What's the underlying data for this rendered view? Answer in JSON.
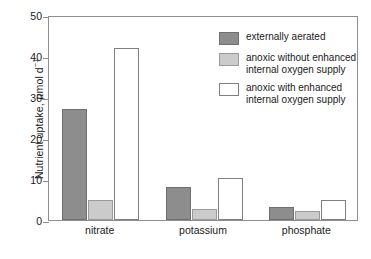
{
  "chart_data": {
    "type": "bar",
    "title": "",
    "xlabel": "",
    "ylabel": "Nutrient uptake, μmol d⁻¹",
    "ylabel_parts": {
      "prefix": "Nutrient uptake, ",
      "unit_mu": "μ",
      "unit_rest": "mol d",
      "unit_exp": "−1"
    },
    "ylim": [
      0,
      50
    ],
    "yticks": [
      0,
      10,
      20,
      30,
      40,
      50
    ],
    "ytick_labels": [
      "0",
      "10",
      "20",
      "30",
      "40",
      "50"
    ],
    "grid": false,
    "legend_position": "upper right",
    "categories": [
      "nitrate",
      "potassium",
      "phosphate"
    ],
    "series": [
      {
        "name": "externally aerated",
        "label_lines": [
          "externally aerated"
        ],
        "color": "#8d8d8d",
        "edge": "#6f6f6f",
        "values": [
          27.0,
          8.0,
          3.1
        ]
      },
      {
        "name": "anoxic without enhanced internal oxygen supply",
        "label_lines": [
          "anoxic without enhanced",
          "internal oxygen supply"
        ],
        "color": "#cbcbcb",
        "edge": "#9a9a9a",
        "values": [
          5.0,
          2.7,
          2.2
        ]
      },
      {
        "name": "anoxic with enhanced internal oxygen supply",
        "label_lines": [
          "anoxic with enhanced",
          "internal oxygen supply"
        ],
        "color": "#ffffff",
        "edge": "#808080",
        "values": [
          42.0,
          10.3,
          4.8
        ]
      }
    ]
  },
  "axes": {
    "frame_color": "#8e8e8e"
  }
}
